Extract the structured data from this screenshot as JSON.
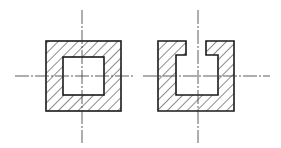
{
  "drawing": {
    "title": "Section views with hatching",
    "colors": {
      "line": "#1a1a1a",
      "centerline": "#333333",
      "background": "#ffffff"
    },
    "figures": [
      {
        "name": "hollow-square-section",
        "outer": {
          "x": 46,
          "y": 41,
          "w": 75,
          "h": 70
        },
        "inner": {
          "x": 63,
          "y": 57,
          "w": 41,
          "h": 38
        },
        "centerlines": {
          "vertical": {
            "x": 82,
            "y1": 10,
            "y2": 143
          },
          "horizontal": {
            "y": 76,
            "x1": 15,
            "x2": 135
          }
        }
      },
      {
        "name": "slotted-channel-section",
        "outline_points": "158,41 186,41 186,55 176,55 176,95 218,95 218,55 206,55 206,41 234,41 234,111 158,111",
        "centerlines": {
          "vertical": {
            "x": 198,
            "y1": 10,
            "y2": 143
          },
          "horizontal": {
            "y": 76,
            "x1": 143,
            "x2": 270
          }
        }
      }
    ]
  }
}
